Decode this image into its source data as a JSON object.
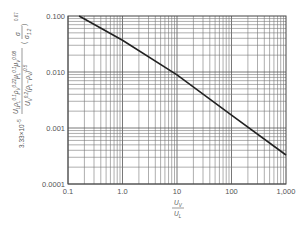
{
  "chart_data": {
    "type": "line",
    "title": "",
    "xscale": "log",
    "yscale": "log",
    "xlabel": "U_V / U_L",
    "ylabel": "3.33×10^-5 · (U_L ρ_L^0.1 ρ_V^0.22 μ_L^0.1 μ_V^0.08) / (U_V^0.2 (ρ_L − ρ_V)^0.5) · (σ / σ_1.2)^0.67",
    "xlim": [
      0.1,
      1000
    ],
    "ylim": [
      0.0001,
      0.1
    ],
    "grid": true,
    "legend": null,
    "xticks": [
      "0.1",
      "1.0",
      "10",
      "100",
      "1,000"
    ],
    "yticks": [
      "0.100",
      "0.010",
      "0.001",
      "0.0001"
    ],
    "series": [
      {
        "name": "correlation",
        "x": [
          0.16,
          1.0,
          10,
          100,
          1000
        ],
        "y": [
          0.1,
          0.037,
          0.0089,
          0.0017,
          0.00033
        ]
      }
    ]
  },
  "labels": {
    "ylabel_prefix": "3.33×10",
    "ylabel_prefix_exp": "−5",
    "ylabel_num": "U",
    "xlabel_num": "U",
    "xlabel_num_sub": "V",
    "xlabel_den": "U",
    "xlabel_den_sub": "L"
  }
}
